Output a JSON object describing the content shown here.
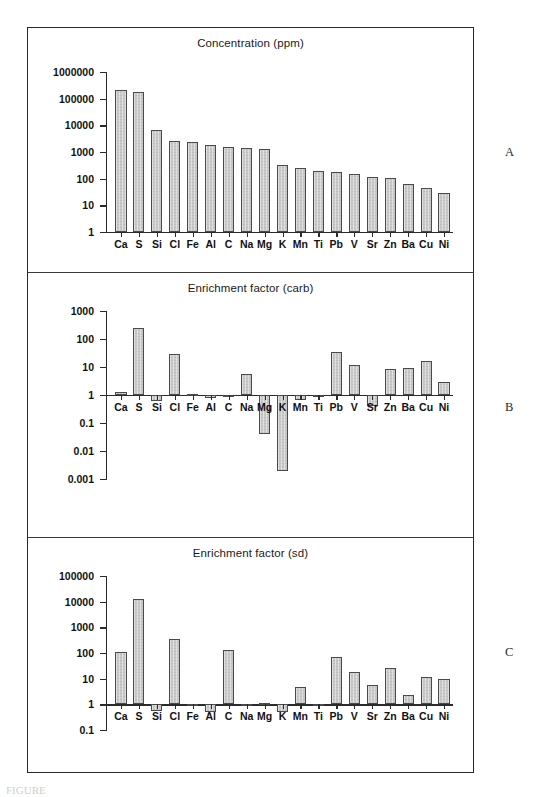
{
  "figure": {
    "panel_letters": [
      "A",
      "B",
      "C"
    ],
    "caption_partial": "FIGURE",
    "bar_color": "#c9c9c9",
    "bar_border_color": "#4a4a4a",
    "axis_color": "#2b2b2b",
    "frame_color": "#2b2b2b"
  },
  "chart_data": [
    {
      "type": "bar",
      "panel": "A",
      "title": "Concentration (ppm)",
      "xlabel": "",
      "ylabel": "",
      "yscale": "log",
      "ylim": [
        1,
        1000000
      ],
      "baseline": 1,
      "grid": false,
      "legend": null,
      "ytick_labels": [
        "1",
        "10",
        "100",
        "1000",
        "10000",
        "100000",
        "1000000"
      ],
      "ytick_values": [
        1,
        10,
        100,
        1000,
        10000,
        100000,
        1000000
      ],
      "categories": [
        "Ca",
        "S",
        "Si",
        "Cl",
        "Fe",
        "Al",
        "C",
        "Na",
        "Mg",
        "K",
        "Mn",
        "Ti",
        "Pb",
        "V",
        "Sr",
        "Zn",
        "Ba",
        "Cu",
        "Ni"
      ],
      "values": [
        220000,
        180000,
        6800,
        2600,
        2400,
        1800,
        1500,
        1450,
        1250,
        320,
        250,
        200,
        185,
        145,
        118,
        110,
        62,
        45,
        30
      ]
    },
    {
      "type": "bar",
      "panel": "B",
      "title": "Enrichment factor (carb)",
      "xlabel": "",
      "ylabel": "",
      "yscale": "log",
      "ylim": [
        0.001,
        1000
      ],
      "baseline": 1,
      "grid": false,
      "legend": null,
      "ytick_labels": [
        "1000",
        "100",
        "10",
        "1",
        "0.1",
        "0.01",
        "0.001"
      ],
      "ytick_values": [
        1000,
        100,
        10,
        1,
        0.1,
        0.01,
        0.001
      ],
      "categories": [
        "Ca",
        "S",
        "Si",
        "Cl",
        "Fe",
        "Al",
        "C",
        "Na",
        "Mg",
        "K",
        "Mn",
        "Ti",
        "Pb",
        "V",
        "Sr",
        "Zn",
        "Ba",
        "Cu",
        "Ni"
      ],
      "values": [
        1.25,
        240,
        0.62,
        28,
        1.05,
        0.78,
        1.0,
        5.6,
        0.042,
        0.0019,
        0.66,
        1.0,
        33,
        11.5,
        0.42,
        8.5,
        9.5,
        17,
        2.8
      ]
    },
    {
      "type": "bar",
      "panel": "C",
      "title": "Enrichment factor (sd)",
      "xlabel": "",
      "ylabel": "",
      "yscale": "log",
      "ylim": [
        0.1,
        100000
      ],
      "baseline": 1,
      "grid": false,
      "legend": null,
      "ytick_labels": [
        "100000",
        "10000",
        "1000",
        "100",
        "10",
        "1",
        "0.1"
      ],
      "ytick_values": [
        100000,
        10000,
        1000,
        100,
        10,
        1,
        0.1
      ],
      "categories": [
        "Ca",
        "S",
        "Si",
        "Cl",
        "Fe",
        "Al",
        "C",
        "Na",
        "Mg",
        "K",
        "Mn",
        "Ti",
        "Pb",
        "V",
        "Sr",
        "Zn",
        "Ba",
        "Cu",
        "Ni"
      ],
      "values": [
        110,
        12500,
        0.55,
        360,
        0.95,
        0.52,
        135,
        1.0,
        1.12,
        0.5,
        4.6,
        1.0,
        68,
        18,
        5.5,
        25,
        2.4,
        12,
        9.5
      ]
    }
  ]
}
